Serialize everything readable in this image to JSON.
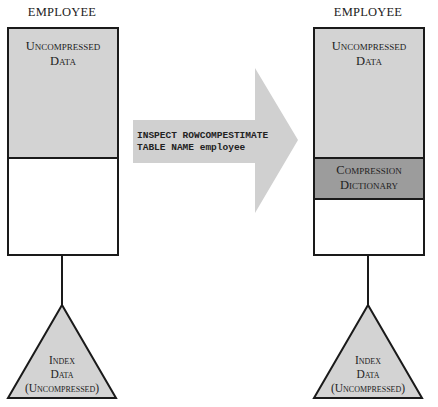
{
  "left_table": {
    "title": "EMPLOYEE",
    "segments": {
      "data_line1": "Uncompressed",
      "data_line2": "Data"
    },
    "index": {
      "line1": "Index",
      "line2": "Data",
      "line3": "(Uncompressed)"
    }
  },
  "arrow": {
    "command_line1": "INSPECT ROWCOMPESTIMATE",
    "command_line2": "TABLE NAME employee"
  },
  "right_table": {
    "title": "EMPLOYEE",
    "segments": {
      "data_line1": "Uncompressed",
      "data_line2": "Data",
      "dict_line1": "Compression",
      "dict_line2": "Dictionary"
    },
    "index": {
      "line1": "Index",
      "line2": "Data",
      "line3": "(Uncompressed)"
    }
  },
  "colors": {
    "data_fill": "#d3d3d3",
    "dictionary_fill": "#9c9c9c",
    "arrow_fill": "#d0d0d0",
    "index_fill": "#d3d3d3",
    "stroke": "#1a1a1a"
  }
}
